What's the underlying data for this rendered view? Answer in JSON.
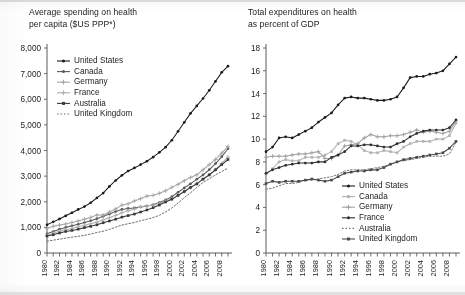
{
  "figure": {
    "background_color": "#ffffff",
    "ink_color": "#1c1c1c"
  },
  "panels": [
    {
      "id": "left",
      "title": "Average spending on health\nper capita ($US PPP*)"
    },
    {
      "id": "right",
      "title": "Total expenditures on health\nas percent of GDP"
    }
  ],
  "chart_data": [
    {
      "type": "line",
      "id": "spending-per-capita",
      "title": "Average spending on health per capita ($US PPP*)",
      "xlabel": "",
      "ylabel": "",
      "grid": false,
      "legend_position": "top-left",
      "xlim": [
        1980,
        2009
      ],
      "ylim": [
        0,
        8000
      ],
      "yticks": [
        0,
        1000,
        2000,
        3000,
        4000,
        5000,
        6000,
        7000,
        8000
      ],
      "ytick_labels": [
        "0",
        "1,000",
        "2,000",
        "3,000",
        "4,000",
        "5,000",
        "6,000",
        "7,000",
        "8,000"
      ],
      "x": [
        1980,
        1981,
        1982,
        1983,
        1984,
        1985,
        1986,
        1987,
        1988,
        1989,
        1990,
        1991,
        1992,
        1993,
        1994,
        1995,
        1996,
        1997,
        1998,
        1999,
        2000,
        2001,
        2002,
        2003,
        2004,
        2005,
        2006,
        2007,
        2008,
        2009
      ],
      "xtick_labels": [
        "1980",
        "1982",
        "1984",
        "1986",
        "1988",
        "1990",
        "1992",
        "1994",
        "1996",
        "1998",
        "2000",
        "2002",
        "2004",
        "2006",
        "2008"
      ],
      "series": [
        {
          "name": "United States",
          "color": "#1b1b1b",
          "style": "solid",
          "marker": "dot",
          "values": [
            1100,
            1215,
            1330,
            1450,
            1570,
            1700,
            1810,
            1960,
            2150,
            2340,
            2600,
            2830,
            3030,
            3200,
            3320,
            3450,
            3580,
            3740,
            3930,
            4130,
            4400,
            4750,
            5100,
            5450,
            5740,
            6030,
            6350,
            6700,
            7050,
            7290
          ]
        },
        {
          "name": "Canada",
          "color": "#5a5a5a",
          "style": "solid",
          "marker": "dot",
          "values": [
            750,
            840,
            930,
            1000,
            1060,
            1120,
            1190,
            1260,
            1340,
            1430,
            1520,
            1620,
            1700,
            1740,
            1760,
            1800,
            1830,
            1880,
            1970,
            2070,
            2200,
            2370,
            2540,
            2700,
            2880,
            3050,
            3250,
            3490,
            3760,
            4070
          ]
        },
        {
          "name": "Germany",
          "color": "#a6a6a6",
          "style": "solid",
          "marker": "plus",
          "values": [
            960,
            1040,
            1090,
            1130,
            1190,
            1250,
            1320,
            1390,
            1480,
            1480,
            1600,
            1720,
            1870,
            1920,
            2030,
            2120,
            2220,
            2250,
            2330,
            2430,
            2560,
            2680,
            2820,
            2950,
            3050,
            3250,
            3450,
            3650,
            3900,
            4160
          ]
        },
        {
          "name": "France",
          "color": "#b0b0b0",
          "style": "solid",
          "marker": "plus",
          "values": [
            680,
            760,
            850,
            910,
            960,
            1020,
            1080,
            1140,
            1210,
            1290,
            1380,
            1470,
            1570,
            1650,
            1710,
            1800,
            1840,
            1860,
            1930,
            2030,
            2120,
            2250,
            2400,
            2550,
            2700,
            2900,
            3050,
            3250,
            3500,
            3750
          ]
        },
        {
          "name": "Australia",
          "color": "#3a3a3a",
          "style": "solid",
          "marker": "square",
          "values": [
            660,
            710,
            780,
            840,
            880,
            930,
            990,
            1040,
            1100,
            1180,
            1250,
            1320,
            1400,
            1460,
            1520,
            1600,
            1680,
            1770,
            1870,
            1990,
            2100,
            2250,
            2400,
            2560,
            2700,
            2880,
            3050,
            3250,
            3450,
            3650
          ]
        },
        {
          "name": "United Kingdom",
          "color": "#6e6e6e",
          "style": "dotted",
          "marker": "none",
          "values": [
            460,
            500,
            540,
            580,
            620,
            650,
            690,
            740,
            800,
            850,
            920,
            1010,
            1090,
            1140,
            1190,
            1260,
            1320,
            1380,
            1470,
            1600,
            1760,
            1950,
            2160,
            2350,
            2560,
            2750,
            2900,
            3050,
            3180,
            3310
          ]
        }
      ]
    },
    {
      "type": "line",
      "id": "expenditure-percent-gdp",
      "title": "Total expenditures on health as percent of GDP",
      "xlabel": "",
      "ylabel": "",
      "grid": false,
      "legend_position": "bottom-right",
      "xlim": [
        1980,
        2009
      ],
      "ylim": [
        0,
        18
      ],
      "yticks": [
        0,
        2,
        4,
        6,
        8,
        10,
        12,
        14,
        16,
        18
      ],
      "ytick_labels": [
        "0",
        "2",
        "4",
        "6",
        "8",
        "10",
        "12",
        "14",
        "16",
        "18"
      ],
      "x": [
        1980,
        1981,
        1982,
        1983,
        1984,
        1985,
        1986,
        1987,
        1988,
        1989,
        1990,
        1991,
        1992,
        1993,
        1994,
        1995,
        1996,
        1997,
        1998,
        1999,
        2000,
        2001,
        2002,
        2003,
        2004,
        2005,
        2006,
        2007,
        2008,
        2009
      ],
      "xtick_labels": [
        "1980",
        "1982",
        "1984",
        "1986",
        "1988",
        "1990",
        "1992",
        "1994",
        "1996",
        "1998",
        "2000",
        "2002",
        "2004",
        "2006",
        "2008"
      ],
      "series": [
        {
          "name": "United States",
          "color": "#1b1b1b",
          "style": "solid",
          "marker": "dot",
          "values": [
            8.9,
            9.3,
            10.1,
            10.2,
            10.1,
            10.4,
            10.7,
            11.0,
            11.5,
            11.9,
            12.3,
            13.0,
            13.6,
            13.7,
            13.6,
            13.6,
            13.5,
            13.4,
            13.4,
            13.5,
            13.7,
            14.5,
            15.4,
            15.5,
            15.5,
            15.7,
            15.8,
            16.0,
            16.6,
            17.2
          ]
        },
        {
          "name": "Canada",
          "color": "#b3b3b3",
          "style": "solid",
          "marker": "square",
          "values": [
            6.9,
            7.4,
            8.0,
            8.2,
            8.1,
            8.1,
            8.4,
            8.4,
            8.4,
            8.6,
            8.9,
            9.6,
            9.9,
            9.8,
            9.5,
            9.0,
            8.8,
            8.8,
            9.0,
            8.9,
            8.8,
            9.3,
            9.6,
            9.8,
            9.8,
            9.8,
            10.0,
            10.0,
            10.3,
            11.4
          ]
        },
        {
          "name": "Germany",
          "color": "#a0a0a0",
          "style": "solid",
          "marker": "plus",
          "values": [
            8.4,
            8.5,
            8.5,
            8.5,
            8.6,
            8.7,
            8.7,
            8.8,
            8.9,
            8.3,
            8.3,
            8.6,
            9.4,
            9.5,
            9.6,
            10.1,
            10.4,
            10.2,
            10.2,
            10.3,
            10.3,
            10.4,
            10.6,
            10.8,
            10.6,
            10.7,
            10.6,
            10.5,
            10.7,
            11.6
          ]
        },
        {
          "name": "France",
          "color": "#2e2e2e",
          "style": "solid",
          "marker": "dot",
          "values": [
            7.0,
            7.3,
            7.5,
            7.7,
            7.8,
            7.9,
            7.9,
            7.9,
            8.0,
            8.0,
            8.4,
            8.6,
            8.9,
            9.4,
            9.4,
            9.5,
            9.5,
            9.4,
            9.3,
            9.3,
            9.6,
            9.8,
            10.2,
            10.5,
            10.7,
            10.8,
            10.8,
            10.8,
            11.0,
            11.7
          ]
        },
        {
          "name": "Australia",
          "color": "#777777",
          "style": "dotted",
          "marker": "none",
          "values": [
            5.6,
            5.7,
            5.9,
            6.1,
            6.1,
            6.2,
            6.4,
            6.4,
            6.5,
            6.6,
            6.7,
            6.9,
            7.2,
            7.3,
            7.3,
            7.3,
            7.4,
            7.5,
            7.6,
            7.8,
            8.0,
            8.1,
            8.2,
            8.3,
            8.4,
            8.5,
            8.5,
            8.5,
            8.7,
            9.7
          ]
        },
        {
          "name": "United Kingdom",
          "color": "#4a4a4a",
          "style": "solid",
          "marker": "square",
          "values": [
            6.1,
            6.3,
            6.2,
            6.3,
            6.3,
            6.3,
            6.4,
            6.5,
            6.4,
            6.3,
            6.4,
            6.7,
            7.0,
            7.1,
            7.2,
            7.2,
            7.3,
            7.3,
            7.5,
            7.8,
            8.0,
            8.2,
            8.3,
            8.4,
            8.5,
            8.6,
            8.7,
            8.8,
            9.2,
            9.8
          ]
        }
      ]
    }
  ]
}
